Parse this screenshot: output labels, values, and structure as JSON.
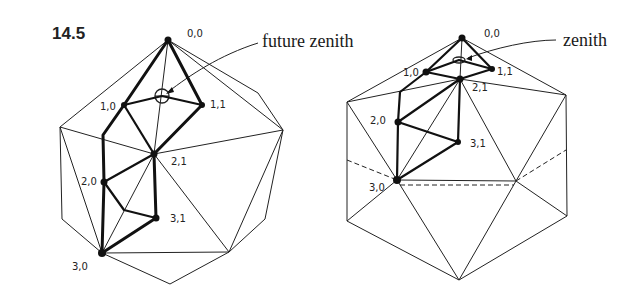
{
  "figure": {
    "number": "14.5",
    "left_panel": {
      "callout": "future zenith",
      "vertex_labels": [
        "0,0",
        "1,0",
        "1,1",
        "2,0",
        "2,1",
        "3,0",
        "3,1"
      ]
    },
    "right_panel": {
      "callout": "zenith",
      "vertex_labels": [
        "0,0",
        "1,0",
        "1,1",
        "2,0",
        "2,1",
        "3,0",
        "3,1"
      ]
    }
  },
  "colors": {
    "ink": "#111111",
    "background": "#ffffff"
  }
}
